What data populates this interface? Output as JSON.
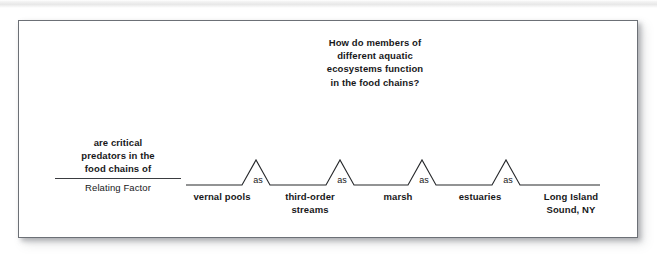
{
  "figure": {
    "heading": {
      "lines": [
        "How do members of",
        "different aquatic",
        "ecosystems function",
        "in the food chains?"
      ]
    },
    "relating_factor": {
      "phrase_lines": [
        "are critical",
        "predators in the",
        "food chains of"
      ],
      "caption": "Relating Factor"
    },
    "link_label": "as",
    "nodes": [
      {
        "lines": [
          "vernal pools"
        ]
      },
      {
        "lines": [
          "third-order",
          "streams"
        ]
      },
      {
        "lines": [
          "marsh"
        ]
      },
      {
        "lines": [
          "estuaries"
        ]
      },
      {
        "lines": [
          "Long Island",
          "Sound, NY"
        ]
      }
    ]
  }
}
